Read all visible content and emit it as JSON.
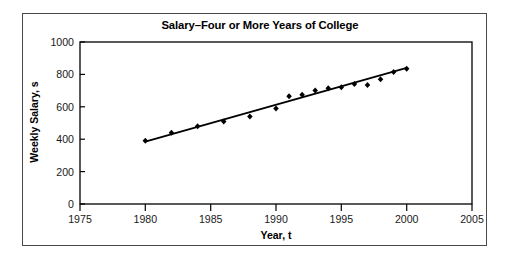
{
  "chart_data": {
    "type": "scatter",
    "title": "Salary–Four or More Years of College",
    "xlabel": "Year, t",
    "ylabel": "Weekly Salary, s",
    "xlim": [
      1975,
      2005
    ],
    "ylim": [
      0,
      1000
    ],
    "xticks": [
      1975,
      1980,
      1985,
      1990,
      1995,
      2000,
      2005
    ],
    "yticks": [
      0,
      200,
      400,
      600,
      800,
      1000
    ],
    "grid": false,
    "legend": null,
    "x": [
      1980,
      1982,
      1984,
      1986,
      1988,
      1990,
      1991,
      1992,
      1993,
      1994,
      1995,
      1996,
      1997,
      1998,
      1999,
      2000
    ],
    "values": [
      390,
      440,
      480,
      510,
      540,
      590,
      665,
      675,
      700,
      715,
      720,
      740,
      735,
      770,
      815,
      835
    ],
    "series": [
      {
        "name": "Weekly salary",
        "marker": "diamond",
        "values": [
          390,
          440,
          480,
          510,
          540,
          590,
          665,
          675,
          700,
          715,
          720,
          740,
          735,
          770,
          815,
          835
        ]
      },
      {
        "name": "Linear regression line",
        "type": "line",
        "x": [
          1980,
          2000
        ],
        "values": [
          385,
          840
        ]
      }
    ]
  },
  "colors": {
    "frame": "#4a4a4a",
    "axis": "#000000",
    "marker": "#000000",
    "fit_line": "#000000",
    "background": "#ffffff"
  }
}
